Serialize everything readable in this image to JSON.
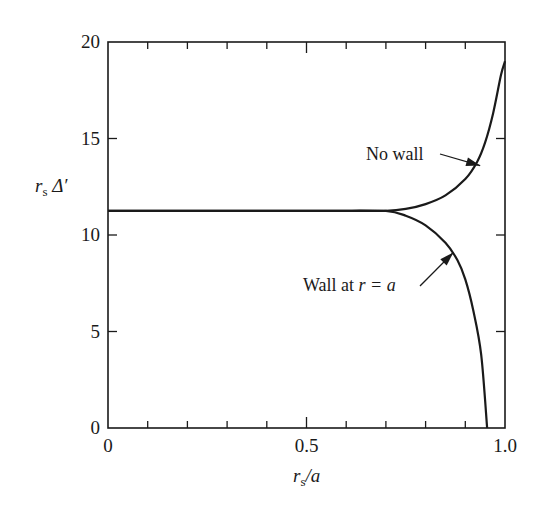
{
  "chart_data": {
    "type": "line",
    "title": "",
    "xlabel": "r_s/a",
    "ylabel": "r_s Δ'",
    "xlim": [
      0,
      1.0
    ],
    "ylim": [
      0,
      20
    ],
    "grid": false,
    "legend": null,
    "x_ticks": [
      0,
      0.5,
      1.0
    ],
    "x_tick_labels": [
      "0",
      "0.5",
      "1.0"
    ],
    "x_minor_step": 0.1,
    "y_ticks": [
      0,
      5,
      10,
      15,
      20
    ],
    "y_tick_labels": [
      "0",
      "5",
      "10",
      "15",
      "20"
    ],
    "series": [
      {
        "name": "No wall",
        "x": [
          0,
          0.1,
          0.2,
          0.3,
          0.4,
          0.5,
          0.6,
          0.7,
          0.75,
          0.8,
          0.85,
          0.9,
          0.93,
          0.95,
          0.97,
          0.99,
          1.0
        ],
        "y": [
          11.25,
          11.25,
          11.25,
          11.25,
          11.25,
          11.25,
          11.25,
          11.25,
          11.35,
          11.6,
          12.05,
          12.9,
          13.8,
          14.8,
          16.3,
          18.3,
          19.0
        ]
      },
      {
        "name": "Wall at r=a",
        "x": [
          0,
          0.1,
          0.2,
          0.3,
          0.4,
          0.5,
          0.6,
          0.7,
          0.75,
          0.8,
          0.85,
          0.88,
          0.9,
          0.92,
          0.94,
          0.955
        ],
        "y": [
          11.25,
          11.25,
          11.25,
          11.25,
          11.25,
          11.25,
          11.25,
          11.25,
          11.0,
          10.5,
          9.6,
          8.7,
          7.7,
          6.1,
          3.8,
          0
        ]
      }
    ],
    "annotations": [
      {
        "text": "No wall",
        "series": "No wall",
        "arrow_to": [
          0.945,
          13.7
        ]
      },
      {
        "text": "Wall at r = a",
        "series": "Wall at r=a",
        "arrow_to": [
          0.875,
          9.2
        ]
      }
    ]
  },
  "labels": {
    "ylabel_main": "r",
    "ylabel_sub": "s",
    "ylabel_rest": " Δ′",
    "xlabel_main": "r",
    "xlabel_sub": "s",
    "xlabel_rest": "/a",
    "annot_no_wall": "No wall",
    "annot_wall_prefix": "Wall at ",
    "annot_wall_math": "r = a"
  }
}
